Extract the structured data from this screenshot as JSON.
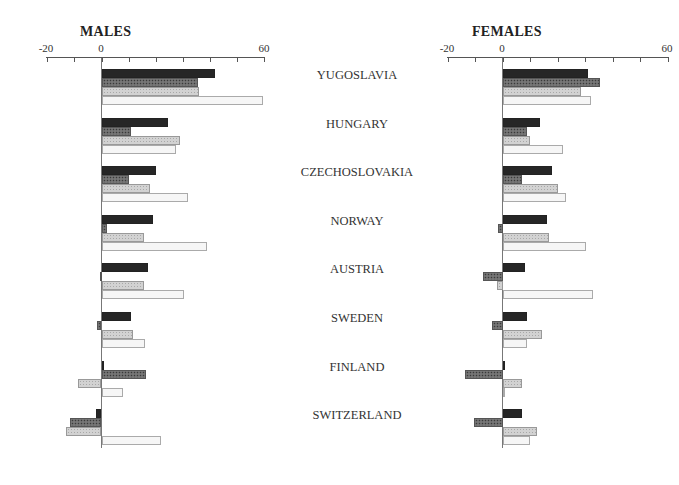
{
  "chart_data": [
    {
      "type": "bar",
      "orientation": "horizontal",
      "title": "MALES",
      "categories": [
        "YUGOSLAVIA",
        "HUNGARY",
        "CZECHOSLOVAKIA",
        "NORWAY",
        "AUSTRIA",
        "SWEDEN",
        "FINLAND",
        "SWITZERLAND"
      ],
      "series": [
        {
          "name": "series-1 (solid dark)",
          "values": [
            42,
            24.5,
            20,
            19,
            17,
            11,
            1,
            -2
          ]
        },
        {
          "name": "series-2 (dark crosshatch)",
          "values": [
            35.5,
            11,
            10,
            2,
            -0.5,
            -1.5,
            16.5,
            -11.5
          ]
        },
        {
          "name": "series-3 (light dotted)",
          "values": [
            36,
            29,
            18,
            15.5,
            15.5,
            11.5,
            -8.5,
            -13
          ]
        },
        {
          "name": "series-4 (white)",
          "values": [
            59.5,
            27.5,
            32,
            39,
            30.5,
            16,
            8,
            22
          ]
        }
      ],
      "xlim": [
        -20,
        60
      ],
      "xticks": [
        -20,
        -10,
        0,
        10,
        20,
        30,
        40,
        50,
        60
      ],
      "xtick_labels": [
        "-20",
        "0",
        "60"
      ],
      "xlabel": "",
      "ylabel": "",
      "grid": false,
      "legend": null
    },
    {
      "type": "bar",
      "orientation": "horizontal",
      "title": "FEMALES",
      "categories": [
        "YUGOSLAVIA",
        "HUNGARY",
        "CZECHOSLOVAKIA",
        "NORWAY",
        "AUSTRIA",
        "SWEDEN",
        "FINLAND",
        "SWITZERLAND"
      ],
      "series": [
        {
          "name": "series-1 (solid dark)",
          "values": [
            31,
            13.5,
            18,
            16,
            8,
            9,
            1,
            7
          ]
        },
        {
          "name": "series-2 (dark crosshatch)",
          "values": [
            35.5,
            9,
            7,
            -1.5,
            -7,
            -4,
            -13.5,
            -10.5
          ]
        },
        {
          "name": "series-3 (light dotted)",
          "values": [
            28.5,
            10,
            20,
            17,
            -2,
            14.5,
            7,
            12.5
          ]
        },
        {
          "name": "series-4 (white)",
          "values": [
            32,
            22,
            23,
            30.5,
            33,
            9,
            0.5,
            10
          ]
        }
      ],
      "xlim": [
        -20,
        60
      ],
      "xticks": [
        -20,
        -10,
        0,
        10,
        20,
        30,
        40,
        50,
        60
      ],
      "xtick_labels": [
        "-20",
        "0",
        "60"
      ],
      "xlabel": "",
      "ylabel": "",
      "grid": false,
      "legend": null
    }
  ],
  "panels": {
    "males": {
      "title": "MALES",
      "tick_labels": [
        "-20",
        "0",
        "60"
      ]
    },
    "females": {
      "title": "FEMALES",
      "tick_labels": [
        "-20",
        "0",
        "60"
      ]
    }
  },
  "countries": [
    "YUGOSLAVIA",
    "HUNGARY",
    "CZECHOSLOVAKIA",
    "NORWAY",
    "AUSTRIA",
    "SWEDEN",
    "FINLAND",
    "SWITZERLAND"
  ]
}
